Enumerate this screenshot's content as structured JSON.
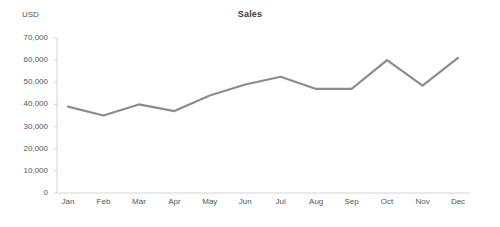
{
  "chart_data": {
    "type": "line",
    "title": "Sales",
    "xlabel": "",
    "ylabel": "USD",
    "categories": [
      "Jan",
      "Feb",
      "Mar",
      "Apr",
      "May",
      "Jun",
      "Jul",
      "Aug",
      "Sep",
      "Oct",
      "Nov",
      "Dec"
    ],
    "values": [
      39000,
      35000,
      40000,
      37000,
      44000,
      49000,
      52500,
      47000,
      47000,
      60000,
      48500,
      61000
    ],
    "series": [
      {
        "name": "Sales",
        "values": [
          39000,
          35000,
          40000,
          37000,
          44000,
          49000,
          52500,
          47000,
          47000,
          60000,
          48500,
          61000
        ],
        "color": "#8c8c8c"
      }
    ],
    "ylim": [
      0,
      70000
    ],
    "ytick_values": [
      0,
      10000,
      20000,
      30000,
      40000,
      50000,
      60000,
      70000
    ],
    "ytick_labels": [
      "0",
      "10,000",
      "20,000",
      "30,000",
      "40,000",
      "50,000",
      "60,000",
      "70,000"
    ],
    "grid": false,
    "legend": false,
    "line_color": "#8c8c8c",
    "axis_color": "#d4d4d4",
    "markers": false
  }
}
